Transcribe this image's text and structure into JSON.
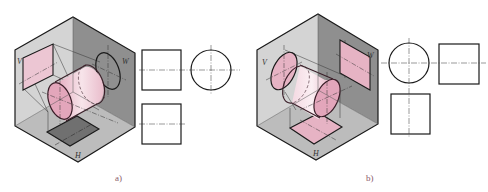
{
  "figures": [
    {
      "id": "a",
      "caption": "a)",
      "labels": {
        "v": "V",
        "w": "W",
        "h": "H"
      },
      "description": "Cylinder with axis perpendicular to W plane; projections: rectangle on V, circle (ellipse in iso) on W, rectangle on H"
    },
    {
      "id": "b",
      "caption": "b)",
      "labels": {
        "v": "V",
        "w": "W",
        "h": "H"
      },
      "description": "Cylinder with axis perpendicular to V plane; projections: circle (ellipse in iso) on V, rectangle on W, rectangle on H"
    }
  ],
  "colors": {
    "left_wall": "#d4d4d4",
    "right_wall": "#8f8f8f",
    "floor": "#bcbcbc",
    "pink": "#e6b3c4",
    "dark_projection": "#707070",
    "stroke": "#1a1a1a"
  }
}
